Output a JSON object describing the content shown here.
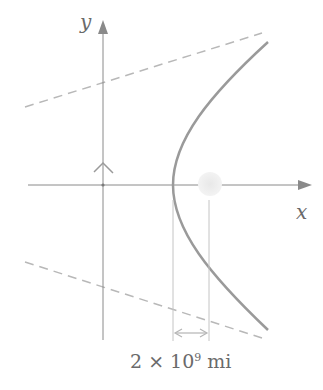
{
  "diagram": {
    "axes": {
      "x_label": "x",
      "y_label": "y"
    },
    "annotation": {
      "prefix": "2 × 10",
      "exponent": "9",
      "unit": " mi"
    },
    "elements": [
      "x-axis",
      "y-axis",
      "asymptote-1",
      "asymptote-2",
      "right-angle-marker",
      "hyperbola-branch",
      "focus-sun",
      "distance-dimension"
    ],
    "colors": {
      "axis": "#8a8a8a",
      "curve": "#9a9a9a",
      "dashed": "#b5b5b5",
      "sun": "#e2e2e2"
    }
  }
}
